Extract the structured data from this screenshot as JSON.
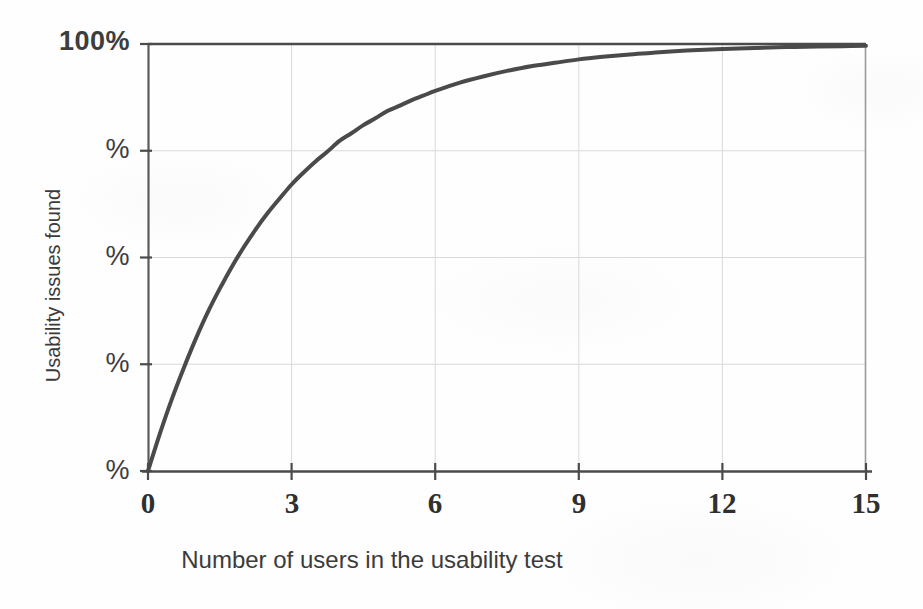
{
  "figure": {
    "background_color": "#fefefe",
    "ink_color": "#3d3d3d"
  },
  "chart_data": {
    "type": "line",
    "title": "",
    "subtitle": "",
    "xlabel": "Number of users in the usability test",
    "ylabel": "Usability issues found",
    "xlim": [
      0,
      15
    ],
    "ylim": [
      0,
      100
    ],
    "xticks": [
      0,
      3,
      6,
      9,
      12,
      15
    ],
    "xtick_labels": [
      "0",
      "3",
      "6",
      "9",
      "12",
      "15"
    ],
    "yticks": [
      0,
      25,
      50,
      75,
      100
    ],
    "ytick_labels": [
      "%",
      "%",
      "%",
      "%",
      "100%"
    ],
    "ytick_note": "Lower four y-axis labels show only the percent sign; their digits are illegible in this scan.",
    "grid": true,
    "grid_color": "#d8d8d8",
    "legend": "none",
    "annotations": [],
    "curve_color": "#4a4a4a",
    "curve_width": 4,
    "series": [
      {
        "name": "Usability issues found",
        "formula": "100 * (1 - (1 - 0.31)^n)",
        "x": [
          0,
          0.25,
          0.5,
          0.75,
          1,
          1.25,
          1.5,
          1.75,
          2,
          2.25,
          2.5,
          2.75,
          3,
          3.25,
          3.5,
          3.75,
          4,
          4.25,
          4.5,
          4.75,
          5,
          5.25,
          5.5,
          5.75,
          6,
          6.5,
          7,
          7.5,
          8,
          8.5,
          9,
          9.5,
          10,
          10.5,
          11,
          11.5,
          12,
          12.5,
          13,
          13.5,
          14,
          14.5,
          15
        ],
        "values": [
          0.0,
          8.8,
          16.9,
          24.2,
          31.0,
          37.2,
          42.7,
          47.8,
          52.4,
          56.6,
          60.4,
          63.8,
          67.1,
          69.9,
          72.5,
          74.8,
          77.3,
          79.1,
          81.0,
          82.6,
          84.3,
          85.5,
          86.8,
          87.9,
          89.0,
          90.9,
          92.4,
          93.7,
          94.8,
          95.6,
          96.4,
          97.0,
          97.5,
          97.9,
          98.3,
          98.6,
          98.8,
          99.0,
          99.2,
          99.3,
          99.4,
          99.5,
          99.6
        ]
      }
    ]
  }
}
